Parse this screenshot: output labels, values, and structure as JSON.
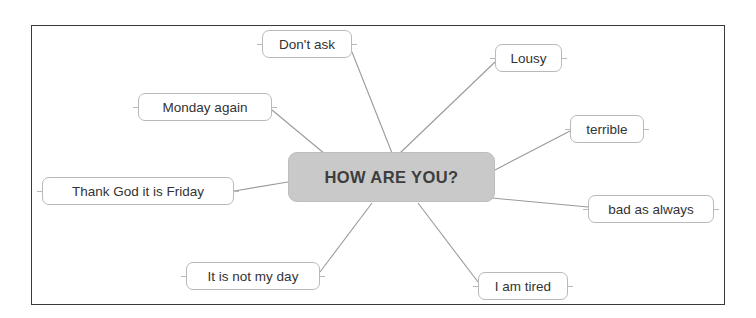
{
  "diagram": {
    "type": "mind-map",
    "title": "HOW ARE YOU?",
    "frame": {
      "border_color": "#3a3a3a",
      "background": "#ffffff"
    },
    "center": {
      "label": "HOW ARE YOU?",
      "fill_color": "#c9c9c9",
      "text_color": "#3d3d3d",
      "x": 288,
      "y": 152,
      "width": 207,
      "height": 50
    },
    "link_color": "#9a9a9a",
    "leaves": [
      {
        "id": "dont-ask",
        "label": "Don't ask",
        "x": 262,
        "y": 30,
        "width": 90,
        "height": 28,
        "link": {
          "x1": 352,
          "y1": 52,
          "x2": 392,
          "y2": 153
        }
      },
      {
        "id": "lousy",
        "label": "Lousy",
        "x": 495,
        "y": 44,
        "width": 67,
        "height": 28,
        "link": {
          "x1": 495,
          "y1": 62,
          "x2": 400,
          "y2": 153
        }
      },
      {
        "id": "monday-again",
        "label": "Monday again",
        "x": 138,
        "y": 93,
        "width": 134,
        "height": 28,
        "link": {
          "x1": 272,
          "y1": 110,
          "x2": 325,
          "y2": 154
        }
      },
      {
        "id": "terrible",
        "label": "terrible",
        "x": 570,
        "y": 115,
        "width": 74,
        "height": 28,
        "link": {
          "x1": 570,
          "y1": 131,
          "x2": 495,
          "y2": 170
        }
      },
      {
        "id": "thank-god-it-is-friday",
        "label": "Thank God it is Friday",
        "x": 42,
        "y": 177,
        "width": 192,
        "height": 28,
        "link": {
          "x1": 234,
          "y1": 191,
          "x2": 288,
          "y2": 182
        }
      },
      {
        "id": "bad-as-always",
        "label": "bad as always",
        "x": 588,
        "y": 195,
        "width": 126,
        "height": 28,
        "link": {
          "x1": 588,
          "y1": 207,
          "x2": 492,
          "y2": 198
        }
      },
      {
        "id": "it-is-not-my-day",
        "label": "It is not my day",
        "x": 186,
        "y": 262,
        "width": 134,
        "height": 28,
        "link": {
          "x1": 320,
          "y1": 272,
          "x2": 372,
          "y2": 203
        }
      },
      {
        "id": "i-am-tired",
        "label": "I am tired",
        "x": 478,
        "y": 272,
        "width": 90,
        "height": 28,
        "link": {
          "x1": 478,
          "y1": 282,
          "x2": 418,
          "y2": 203
        }
      }
    ]
  }
}
